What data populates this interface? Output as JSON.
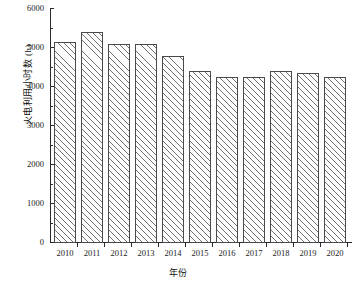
{
  "chart_data": {
    "type": "bar",
    "title": "",
    "xlabel": "年份",
    "ylabel": "火电利用小时数 (h)",
    "categories": [
      "2010",
      "2011",
      "2012",
      "2013",
      "2014",
      "2015",
      "2016",
      "2017",
      "2018",
      "2019",
      "2020"
    ],
    "values": [
      5130,
      5380,
      5080,
      5080,
      4780,
      4400,
      4250,
      4250,
      4400,
      4350,
      4250
    ],
    "ylim": [
      0,
      6000
    ],
    "yticks": [
      0,
      1000,
      2000,
      3000,
      4000,
      5000,
      6000
    ],
    "ytick_labels": [
      "0",
      "1000",
      "2000",
      "3000",
      "4000",
      "5000",
      "6000"
    ],
    "minor_yticks": [
      500,
      1500,
      2500,
      3500,
      4500,
      5500
    ],
    "grid": false,
    "legend": false,
    "bar_fill": "hatched-diagonal",
    "bar_edge_color": "#4a4a4a",
    "axis_color": "#2b2b2b",
    "background": "#ffffff"
  }
}
